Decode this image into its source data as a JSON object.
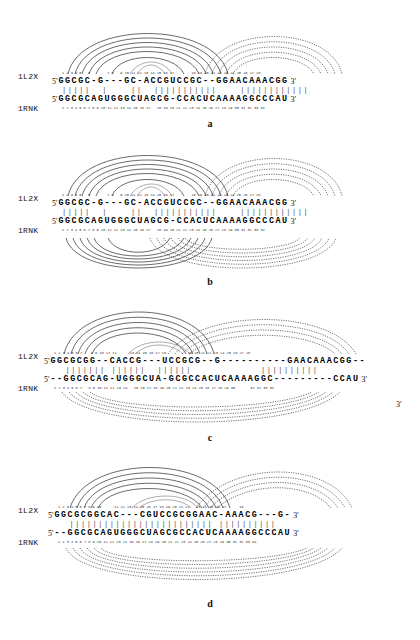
{
  "figure": {
    "caption_letters": [
      "a",
      "b",
      "c",
      "d"
    ],
    "structures": [
      "1L2X",
      "1RNK"
    ],
    "five_prime": "5'",
    "three_prime": "3'"
  },
  "panels": [
    {
      "letter": "a",
      "top": {
        "label": "1L2X",
        "numbers": "1 2 3 4 5   6        7 8   9 10 11 12 13 14 15 16 17        18 19 20 21 22 23 24 25 26 27 28",
        "sequence": "GGCGC-G---GC-ACCGUCCGC--GGAACAAACGG",
        "five": "5'",
        "three": "3'"
      },
      "match_bars": "|||||  |    ||  |||||||||||    ||||||||||||",
      "bottom": {
        "label": "1RNK",
        "numbers": "1 2 3 4 5 6 7 8 9 10 11 12 13 14 15 16 17   18 19 20 21 22 23 24 25 26 27 28 29 30 31 32 33 34",
        "sequence": "GGCGCAGUGGGCUAGCG-CCACUCAAAAGGCCCAU",
        "five": "5'",
        "three": "3'"
      },
      "arcs_above": "solid-and-dotted",
      "arcs_below": "none"
    },
    {
      "letter": "b",
      "top": {
        "label": "1L2X",
        "numbers": "1 2 3 4 5   6        7 8   9 10 11 12 13 14 15 16 17        18 19 20 21 22 23 24 25 26 27 28",
        "sequence": "GGCGC-G---GC-ACCGUCCGC--GGAACAAACGG",
        "five": "5'",
        "three": "3'"
      },
      "match_bars": "|||||  |    ||  |||||||||||    ||||||||||||",
      "bottom": {
        "label": "1RNK",
        "numbers": "1 2 3 4 5 6 7 8 9 10 11 12 13 14 15 16 17   18 19 20 21 22 23 24 25 26 27 28 29 30 31 32 33 34",
        "sequence": "GGCGCAGUGGGCUAGCG-CCACUCAAAAGGCCCAU",
        "five": "5'",
        "three": "3'"
      },
      "arcs_above": "solid-and-dotted",
      "arcs_below": "solid-and-dotted"
    },
    {
      "letter": "c",
      "top": {
        "label": "1L2X",
        "numbers": "1 2 3 4 5 6 7    8 9 10 11 12      13 14 15 16 17 18          19 20 21 22 23 24 25 26 27 28",
        "sequence": "GGCGCGG--CACCG---UCCGCG--G----------GAACAAACGG--",
        "five": "5'",
        "three": ""
      },
      "match_bars": "  ||||||| ||||||  ||||||            ||||||||||",
      "bottom": {
        "label": "1RNK",
        "numbers": "1 2 3 4 5 6 7   8 9 10 11 12 13 14   15 16 17 18 19 20 21 22 23 24 25 26 27 28 29 30       31 32 33 34",
        "sequence": "--GGCGCAG-UGGGCUA-GCGCCACUCAAAAGGC---------CCAU",
        "five": "5'",
        "three": "3'"
      },
      "arcs_above": "solid-and-dotted",
      "arcs_below": "dotted",
      "extra_three_prime": "3'"
    },
    {
      "letter": "d",
      "top": {
        "label": "1L2X",
        "numbers": "1 2 3 4 5 6 7 8 9 10      11 12 13 14 15 16 17 18 19 20 21 22   23 24 25 26 27      28",
        "sequence": "GGCGCGGCAC---CGUCCGCGGAAC-AAACG---G-",
        "five": "5'",
        "three": "3'"
      },
      "match_bars": "  ||||||||||||||||||||||||| ||||||||||",
      "bottom": {
        "label": "1RNK",
        "numbers": "1 2 3 4 5 6 7 8 9 10 11 12 13 14 15 16 17 18 19 20 21 22 23 24 25 26 27 28 29 30 31 32 33 34",
        "sequence": "--GGCGCAGUGGGCUAGCGCCACUCAAAAGGCCCAU",
        "five": "5'",
        "three": "3'"
      },
      "arcs_above": "solid-and-dotted",
      "arcs_below": "dotted"
    }
  ]
}
